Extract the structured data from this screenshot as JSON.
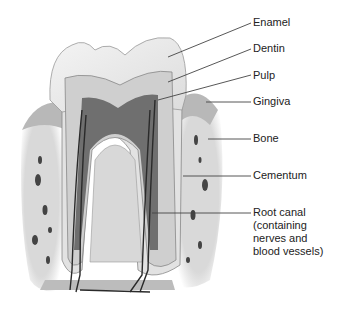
{
  "diagram": {
    "colors": {
      "background": "#ffffff",
      "enamel": "#ededed",
      "dentin": "#cfcfcf",
      "pulp": "#6f6f6f",
      "bone": "#d6d6d6",
      "gingiva": "#bdbdbd",
      "vessel": "#2a2a2a",
      "leader": "#444444",
      "text": "#222222"
    },
    "labels": [
      {
        "id": "enamel",
        "text": "Enamel",
        "x": 253,
        "y": 16
      },
      {
        "id": "dentin",
        "text": "Dentin",
        "x": 253,
        "y": 42
      },
      {
        "id": "pulp",
        "text": "Pulp",
        "x": 253,
        "y": 69
      },
      {
        "id": "gingiva",
        "text": "Gingiva",
        "x": 253,
        "y": 95
      },
      {
        "id": "bone",
        "text": "Bone",
        "x": 253,
        "y": 132
      },
      {
        "id": "cementum",
        "text": "Cementum",
        "x": 253,
        "y": 169
      },
      {
        "id": "root-canal",
        "text": "Root canal\n(containing\nnerves and\nblood vessels)",
        "x": 253,
        "y": 206
      }
    ]
  }
}
